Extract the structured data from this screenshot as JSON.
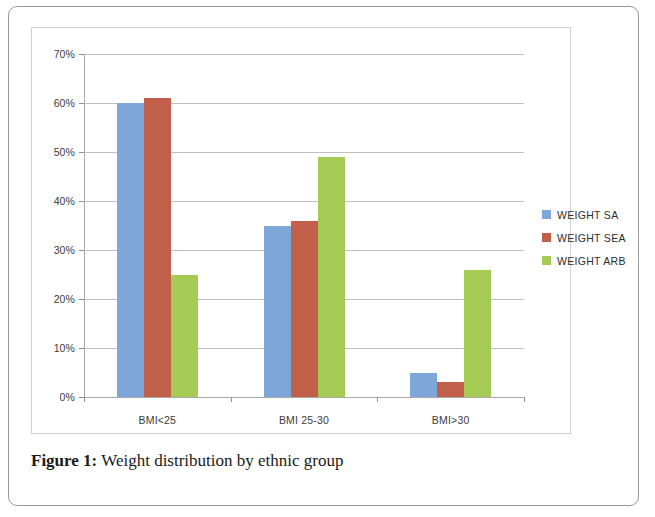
{
  "caption": {
    "label": "Figure 1:",
    "text": " Weight distribution by ethnic group"
  },
  "legend": {
    "position": "right",
    "items": [
      {
        "label": "WEIGHT SA",
        "color": "#7da7d9"
      },
      {
        "label": "WEIGHT SEA",
        "color": "#c0604b"
      },
      {
        "label": "WEIGHT ARB",
        "color": "#a5cb54"
      }
    ]
  },
  "axis": {
    "y_ticks": [
      "0%",
      "10%",
      "20%",
      "30%",
      "40%",
      "50%",
      "60%",
      "70%"
    ],
    "x_ticks": [
      "BMI<25",
      "BMI 25-30",
      "BMI>30"
    ]
  },
  "chart_data": {
    "type": "bar",
    "title": "",
    "xlabel": "",
    "ylabel": "",
    "ylim": [
      0,
      70
    ],
    "ytick_step": 10,
    "ytick_suffix": "%",
    "grid": true,
    "legend_position": "right",
    "categories": [
      "BMI<25",
      "BMI 25-30",
      "BMI>30"
    ],
    "series": [
      {
        "name": "WEIGHT SA",
        "color": "#7da7d9",
        "values": [
          60,
          35,
          5
        ]
      },
      {
        "name": "WEIGHT SEA",
        "color": "#c0604b",
        "values": [
          61,
          36,
          3
        ]
      },
      {
        "name": "WEIGHT ARB",
        "color": "#a5cb54",
        "values": [
          25,
          49,
          26
        ]
      }
    ]
  }
}
